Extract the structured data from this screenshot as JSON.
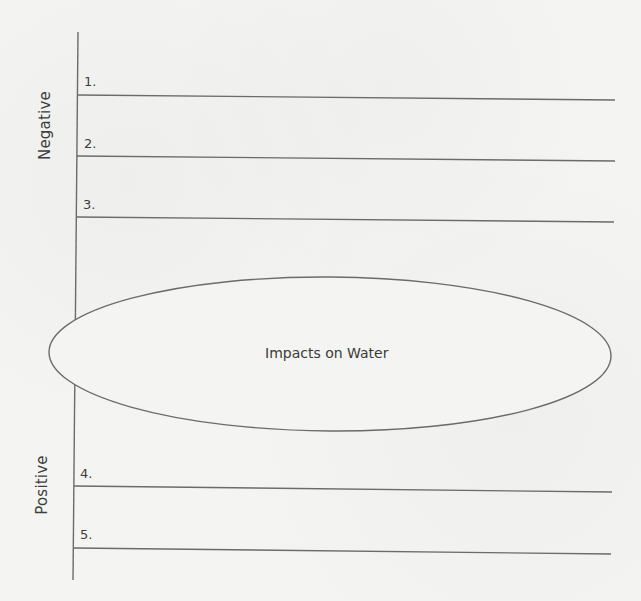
{
  "diagram": {
    "type": "graphic-organizer",
    "center": {
      "label": "Impacts on Water"
    },
    "sections": [
      {
        "label": "Negative",
        "items": [
          {
            "number": "1.",
            "value": ""
          },
          {
            "number": "2.",
            "value": ""
          },
          {
            "number": "3.",
            "value": ""
          }
        ]
      },
      {
        "label": "Positive",
        "items": [
          {
            "number": "4.",
            "value": ""
          },
          {
            "number": "5.",
            "value": ""
          }
        ]
      }
    ],
    "colors": {
      "line": "#6b6b6b",
      "background": "#f4f4f2",
      "text": "#3a3a3a"
    }
  }
}
